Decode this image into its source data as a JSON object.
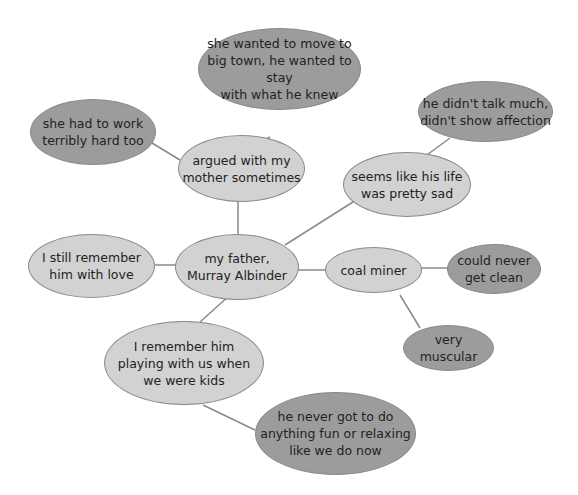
{
  "colors": {
    "light_node": "#d2d2d2",
    "dark_node": "#9c9c9c",
    "line": "#8a8a8a"
  },
  "nodes": {
    "center": {
      "text": "my father,\nMurray Albinder"
    },
    "argued": {
      "text": "argued with my\nmother sometimes"
    },
    "move": {
      "text": "she wanted to move to\nbig town, he wanted to stay\nwith what he knew"
    },
    "work": {
      "text": "she had to work\nterribly hard too"
    },
    "sad": {
      "text": "seems like his life\nwas pretty sad"
    },
    "talk": {
      "text": "he didn't talk much,\ndidn't show affection"
    },
    "love": {
      "text": "I still remember\nhim with love"
    },
    "miner": {
      "text": "coal miner"
    },
    "clean": {
      "text": "could never\nget clean"
    },
    "muscular": {
      "text": "very muscular"
    },
    "playing": {
      "text": "I remember him\nplaying with us when\nwe were kids"
    },
    "fun": {
      "text": "he never got to do\nanything fun or relaxing\nlike we do now"
    }
  }
}
